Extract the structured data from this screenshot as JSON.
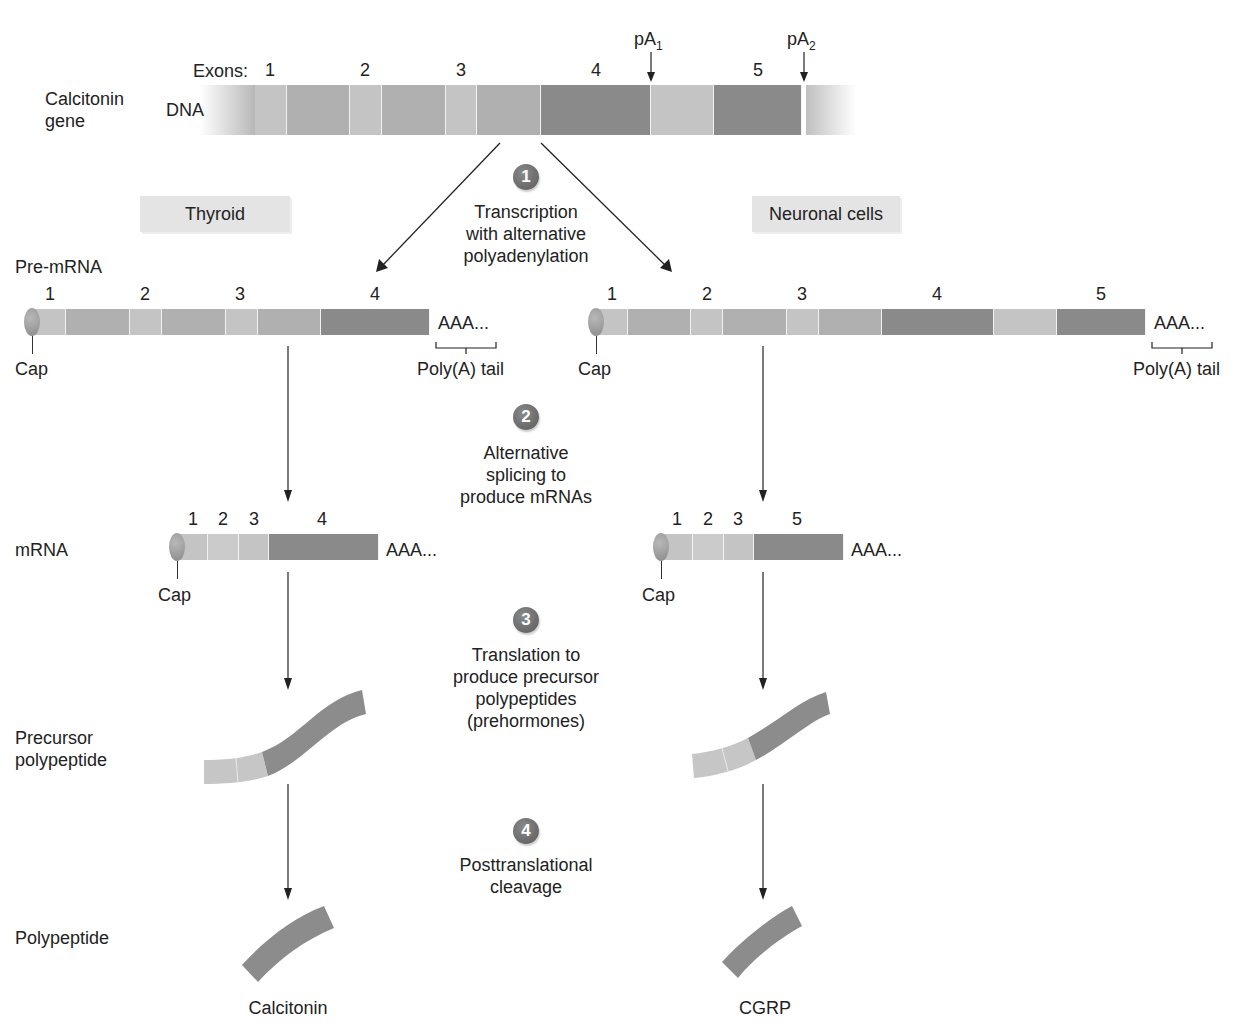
{
  "gene": {
    "title_line1": "Calcitonin",
    "title_line2": "gene",
    "dna_label": "DNA",
    "exons_label": "Exons:",
    "exon_numbers": [
      "1",
      "2",
      "3",
      "4",
      "5"
    ],
    "pa1": "pA",
    "pa1_sub": "1",
    "pa2": "pA",
    "pa2_sub": "2"
  },
  "tissues": {
    "left": "Thyroid",
    "right": "Neuronal cells"
  },
  "steps": [
    {
      "number": "1",
      "line1": "Transcription",
      "line2": "with alternative",
      "line3": "polyadenylation"
    },
    {
      "number": "2",
      "line1": "Alternative",
      "line2": "splicing to",
      "line3": "produce mRNAs"
    },
    {
      "number": "3",
      "line1": "Translation to",
      "line2": "produce precursor",
      "line3": "polypeptides",
      "line4": "(prehormones)"
    },
    {
      "number": "4",
      "line1": "Posttranslational",
      "line2": "cleavage"
    }
  ],
  "row_labels": {
    "pre_mrna": "Pre-mRNA",
    "mrna": "mRNA",
    "precursor_line1": "Precursor",
    "precursor_line2": "polypeptide",
    "polypeptide": "Polypeptide"
  },
  "pre_mrna": {
    "left_exons": [
      "1",
      "2",
      "3",
      "4"
    ],
    "right_exons": [
      "1",
      "2",
      "3",
      "4",
      "5"
    ],
    "cap": "Cap",
    "polya": "AAA...",
    "polya_tail": "Poly(A) tail"
  },
  "mrna": {
    "left_exons": [
      "1",
      "2",
      "3",
      "4"
    ],
    "right_exons": [
      "1",
      "2",
      "3",
      "5"
    ],
    "cap": "Cap",
    "polya": "AAA..."
  },
  "products": {
    "left": "Calcitonin",
    "right": "CGRP"
  },
  "colors": {
    "light_exon": "#c4c4c4",
    "intron": "#b0b0b0",
    "dark_exon": "#8a8a8a",
    "step_circle": "#6e6e6e",
    "tissue_box": "#e4e4e4"
  }
}
